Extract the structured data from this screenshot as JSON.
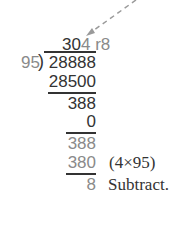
{
  "arrow": {
    "color": "#9a9a9a"
  },
  "quotient": {
    "black": "30",
    "gray": "4",
    "remainder": "r8"
  },
  "divisor": "95",
  "dividend": "28888",
  "steps": [
    {
      "value": "28500",
      "color": "black"
    },
    {
      "value": "388",
      "color": "black"
    },
    {
      "value": "0",
      "color": "black"
    },
    {
      "value": "388",
      "color": "gray"
    },
    {
      "value": "380",
      "color": "gray",
      "note": "(4×95)"
    },
    {
      "value": "8",
      "color": "gray",
      "note": "Subtract."
    }
  ]
}
